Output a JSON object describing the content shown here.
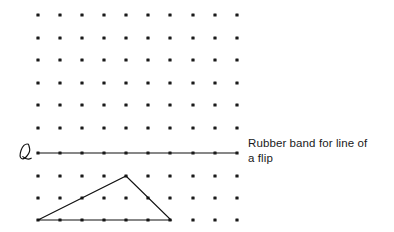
{
  "figure": {
    "background_color": "#ffffff",
    "ink_color": "#111111",
    "dot_color": "#1a1a1a",
    "width": 394,
    "height": 232,
    "line_label": "ℓ",
    "line_label_position": {
      "x": 22,
      "y": 155
    },
    "dot_radius": 1.6,
    "grid": {
      "columns_x": [
        38,
        60,
        82,
        104,
        126,
        148,
        170,
        193,
        215,
        237
      ],
      "rows_y": [
        15,
        38,
        60,
        83,
        105,
        128,
        176,
        198,
        220
      ],
      "row_on_line_y": 153,
      "column_count": 10,
      "row_count": 10
    },
    "flip_line": {
      "name": "rubber-band-line",
      "x1": 38,
      "y1": 153,
      "x2": 237,
      "y2": 153,
      "stroke_width": 1.1
    },
    "triangle": {
      "name": "rubber-band-triangle",
      "vertices": [
        {
          "x": 126,
          "y": 176
        },
        {
          "x": 171,
          "y": 220
        },
        {
          "x": 38,
          "y": 220
        }
      ],
      "stroke_width": 1.1,
      "fill": "none"
    }
  },
  "caption": {
    "line1": "Rubber band for line of",
    "line2": "a flip"
  }
}
